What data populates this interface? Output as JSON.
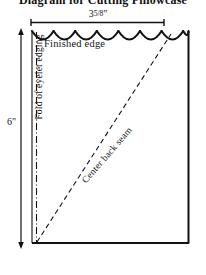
{
  "figure": {
    "title": "Diagram for Cutting Pillowcase",
    "type": "sewing-pattern-diagram",
    "background_color": "#ffffff",
    "line_color": "#111111"
  },
  "dimensions": {
    "width": {
      "whole": "3",
      "fraction": "5/8",
      "unit": "\"",
      "display": "3 5/8\""
    },
    "height": {
      "value": "6",
      "unit": "\"",
      "display": "6\""
    }
  },
  "labels": {
    "finished_edge": "Finished edge",
    "fold_of_eyelet_edging": "Fold of eyelet edging",
    "center_back_seam": "Center back seam"
  },
  "features": {
    "scallop_count": 8,
    "scalloped_edge_name": "scalloped-top-edge",
    "fold_line_style": "dash-dot",
    "seam_line_style": "dashed"
  }
}
